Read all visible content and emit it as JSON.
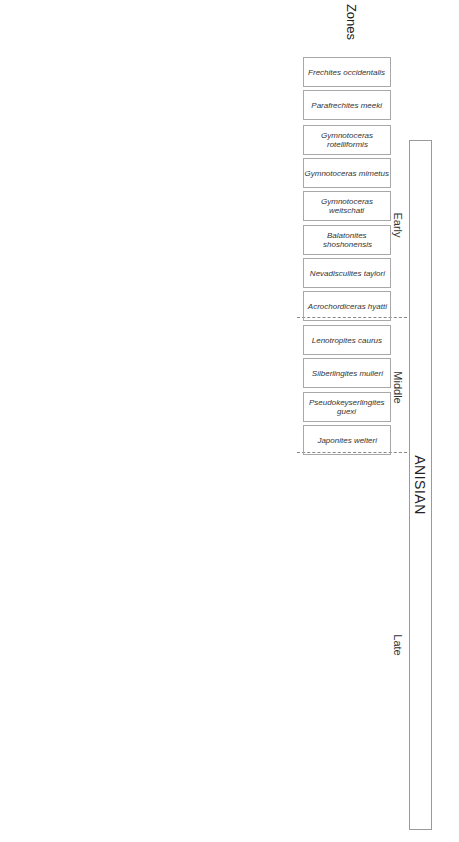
{
  "title": "ANISIAN",
  "periods": [
    {
      "label": "Early"
    },
    {
      "label": "Middle"
    },
    {
      "label": "Late"
    }
  ],
  "zones_label": "Zones",
  "subzones_label": "Subzones",
  "zones": [
    {
      "name": "Frechites occidentalis"
    },
    {
      "name": "Parafrechites meeki"
    },
    {
      "name": "Gymnotoceras rotelliformis"
    },
    {
      "name": "Gymnotoceras mimetus"
    },
    {
      "name": "Gymnotoceras weitschati"
    },
    {
      "name": "Balatonites shoshonensis"
    },
    {
      "name": "Nevadisculites taylori"
    },
    {
      "name": "Acrochordiceras hyatti"
    },
    {
      "name": "Lenotropites caurus"
    },
    {
      "name": "Silberlingites mulleri"
    },
    {
      "name": "Pseudokeyserlingites guexi"
    },
    {
      "name": "Japonites welteri"
    }
  ],
  "subzones": [
    {
      "name": "Gymnotoceras blakei"
    },
    {
      "name": "Brackites vogdesi"
    },
    {
      "name": "Marcouxites spinifer"
    },
    {
      "name": "Dixieceras lawsoni"
    },
    {
      "name": "Rieberites transiformis"
    },
    {
      "name": "Billingsites cordeyi"
    },
    {
      "name": "Bulogites mojsvari"
    }
  ],
  "localities": [
    {
      "label": "Oliver Gulch"
    },
    {
      "label": "Ferguson Canyon"
    },
    {
      "label": "Ferguson West"
    },
    {
      "label": "Rieber Gulch"
    },
    {
      "label": "Favret Canyon"
    },
    {
      "label": "Muller Canyon"
    },
    {
      "label": "McCoy Mine"
    },
    {
      "label": "Fossil Hill"
    }
  ],
  "cells": {
    "oliver_blakei": "? HB 702",
    "oliver_vogdesi_a": "HB 712;\nHB 2043;\nHB 2044;\nHB 747;\nHB 746, 2042;\nHB 748, 2041;\nHB 742, 745;\nHB 703",
    "oliver_vogdesi_b": "HB 749",
    "oliver_lawsoni": "HB 707;\nHB 710;\nHB 711;\nHB 2040;\nHB 597",
    "oliver_rieberites": "HB 596",
    "oliver_cordeyi_a": "HB 713;\nHB 598;\nHB 592;\nHB 584, 590;\nHB 591;\nHB 583;\nHB 708;\nHB 583, 585",
    "oliver_cordeyi_b": "HB 2052",
    "oliver_mojsvari": "HB 741",
    "ferguson_vogdesi": "HB 2023",
    "ferguson_lawsoni": "HB 2027;\nHB 2028",
    "ferguson_cordeyi_a": "HB 2022;\nHB 751;\nHB 2020;\nHB 752;\nHB 2021;\nHB 750;\nHB 738",
    "ferguson_cordeyi_b": "HB 740\nHB 754\nHB 2053",
    "ferguson_mojsvari": "HB 739",
    "fwest_lawsoni": "HB 2037;\nHB 2032",
    "fwest_cordeyi_a": "HB 2036;\nHB 2031\nHB 2030;\nHB 2035;\nHB 2034",
    "fwest_cordeyi_b": "HB 2033",
    "rieber_cordeyi_a": "HB 2006, 2009,\n2010;\nHB 2007;\nHB 2012;\nHB 2008, 2013,\n2014, 2017;\nHB 2005;\nHB 2003;\n2004;\nHB 2016;\nHB 2015",
    "rieber_cordeyi_b": "HB 2050\nHB 2070\nHB 2071\nHB 2072",
    "favret_vogdesi": "HB 2047\nHR ## B\nJJ 2002/1",
    "favret_cordeyi": "JJ 1997/2\nJJ 2004/1",
    "muller_marcouxites": "HB 717\nHB 735",
    "muller_cordeyi": "HB 730\nHB 731\nHB 734\nHB 737",
    "mccoy_vogdesi": "HB 2083",
    "mccoy_lawsoni": "HB 2062",
    "mccoy_cordeyi": "HB 2001,\n2064",
    "mccoy_mojsvari": "HR ## A",
    "fossil_blakei": "FHB 34; FHB 32;\nFHB 31; FHB 30;\nFHB 28",
    "fossil_vogdesi_a": "? FHB 23;\n? FHB 22;\nFHB 20; FHB 18;\nFHB 17; FHB 16;\nFHB 15A;\nFHB 15;\nFHB 14; FHB 13;\nFHB 12",
    "fossil_marcouxites": "FHB 11",
    "fossil_lawsoni": "FHB 9;\nFHB 8;\n? FHB 6"
  },
  "footnote": {
    "line1": "Isolated bedrock samples and single float-block samples without age-diagnostic species at the subzone level: HB 704, 705, 706, 709 (Oliver Gulch);",
    "line2": "HB 753 (Ferguson Canyon); HB 743, 744, 714, 715 (Favret Canyon); HB 736, 717, 716, 732 (Muller Canyon)."
  }
}
